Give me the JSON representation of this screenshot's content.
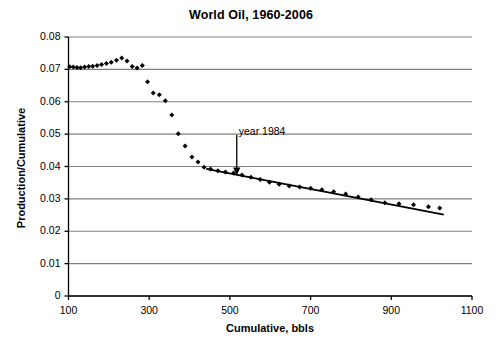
{
  "chart_data": {
    "type": "scatter",
    "title": "World Oil, 1960-2006",
    "xlabel": "Cumulative, bbls",
    "ylabel": "Production/Cumulative",
    "xlim": [
      100,
      1100
    ],
    "ylim": [
      0,
      0.08
    ],
    "grid": true,
    "legend": null,
    "xticks": [
      "100",
      "300",
      "500",
      "700",
      "900",
      "1100"
    ],
    "xtick_values": [
      100,
      300,
      500,
      700,
      900,
      1100
    ],
    "yticks": [
      "0",
      "0.01",
      "0.02",
      "0.03",
      "0.04",
      "0.05",
      "0.06",
      "0.07",
      "0.08"
    ],
    "ytick_values": [
      0,
      0.01,
      0.02,
      0.03,
      0.04,
      0.05,
      0.06,
      0.07,
      0.08
    ],
    "series": [
      {
        "name": "Production/Cumulative",
        "marker": "diamond",
        "color": "#000000",
        "points": [
          [
            103,
            0.0708
          ],
          [
            112,
            0.0707
          ],
          [
            121,
            0.0706
          ],
          [
            130,
            0.0705
          ],
          [
            140,
            0.0707
          ],
          [
            150,
            0.0709
          ],
          [
            160,
            0.071
          ],
          [
            171,
            0.0712
          ],
          [
            182,
            0.0715
          ],
          [
            194,
            0.0718
          ],
          [
            206,
            0.0722
          ],
          [
            219,
            0.0728
          ],
          [
            232,
            0.0735
          ],
          [
            245,
            0.0726
          ],
          [
            258,
            0.0709
          ],
          [
            270,
            0.0704
          ],
          [
            283,
            0.0712
          ],
          [
            296,
            0.0662
          ],
          [
            310,
            0.0627
          ],
          [
            325,
            0.0622
          ],
          [
            340,
            0.0603
          ],
          [
            356,
            0.0559
          ],
          [
            372,
            0.0501
          ],
          [
            389,
            0.0463
          ],
          [
            406,
            0.0429
          ],
          [
            421,
            0.0414
          ],
          [
            436,
            0.0398
          ],
          [
            452,
            0.0392
          ],
          [
            470,
            0.0387
          ],
          [
            489,
            0.0383
          ],
          [
            509,
            0.038
          ],
          [
            530,
            0.0374
          ],
          [
            552,
            0.0367
          ],
          [
            575,
            0.036
          ],
          [
            598,
            0.0351
          ],
          [
            622,
            0.0345
          ],
          [
            647,
            0.034
          ],
          [
            673,
            0.0337
          ],
          [
            700,
            0.0333
          ],
          [
            728,
            0.0328
          ],
          [
            757,
            0.0322
          ],
          [
            787,
            0.0315
          ],
          [
            818,
            0.0306
          ],
          [
            850,
            0.0297
          ],
          [
            884,
            0.0288
          ],
          [
            919,
            0.0285
          ],
          [
            955,
            0.0282
          ],
          [
            992,
            0.0276
          ],
          [
            1020,
            0.0272
          ]
        ]
      }
    ],
    "trendline": {
      "name": "linear fit",
      "color": "#000000",
      "x_start": 441,
      "y_start": 0.0393,
      "x_end": 1030,
      "y_end": 0.0251
    },
    "annotations": [
      {
        "text": "year 1984",
        "label_x": 512,
        "label_y": 0.0508,
        "arrow_x": 517,
        "arrow_y_from": 0.0497,
        "arrow_y_to": 0.0378
      }
    ]
  }
}
